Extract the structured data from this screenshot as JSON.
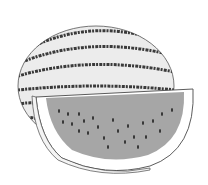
{
  "illustration": {
    "subject": "watermelon",
    "parts": [
      "whole-watermelon",
      "watermelon-slice"
    ],
    "colors": {
      "background": "#ffffff",
      "rind_light": "#ececec",
      "stripe": "#3a3a3a",
      "flesh": "#a6a6a6",
      "seed": "#2e2e2e",
      "outline": "#4a4a4a",
      "slice_rind": "#ffffff"
    }
  }
}
